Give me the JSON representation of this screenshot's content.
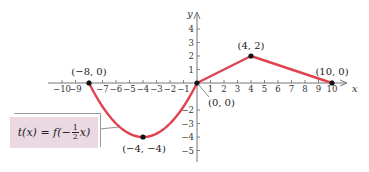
{
  "chart_data": {
    "type": "line",
    "title": "",
    "xlabel": "x",
    "ylabel": "y",
    "xlim": [
      -10.5,
      10.5
    ],
    "ylim": [
      -5.5,
      4.5
    ],
    "grid": false,
    "x_ticks": [
      -10,
      -9,
      -8,
      -7,
      -6,
      -5,
      -4,
      -3,
      -2,
      -1,
      1,
      2,
      3,
      4,
      5,
      6,
      7,
      8,
      9,
      10
    ],
    "x_tick_labels": [
      "−10",
      "−9",
      "",
      "−7",
      "−6",
      "−5",
      "−4",
      "−3",
      "−2",
      "−1",
      "1",
      "2",
      "3",
      "4",
      "5",
      "6",
      "7",
      "8",
      "9",
      "10"
    ],
    "y_ticks": [
      4,
      3,
      2,
      1,
      -2,
      -3,
      -4,
      -5
    ],
    "y_tick_labels": [
      "4",
      "3",
      "2",
      "1",
      "−2",
      "−3",
      "−4",
      "−5"
    ],
    "series": [
      {
        "name": "t(x) = f(−½x)",
        "color": "#e0424f",
        "segments": [
          {
            "kind": "parabola",
            "from": [
              -8,
              0
            ],
            "vertex": [
              -4,
              -4
            ],
            "to": [
              0,
              0
            ]
          },
          {
            "kind": "line",
            "points": [
              [
                0,
                0
              ],
              [
                4,
                2
              ],
              [
                10,
                0
              ]
            ]
          }
        ]
      }
    ],
    "key_points": [
      {
        "x": -8,
        "y": 0,
        "label": "(−8, 0)"
      },
      {
        "x": -4,
        "y": -4,
        "label": "(−4, −4)"
      },
      {
        "x": 0,
        "y": 0,
        "label": "(0, 0)"
      },
      {
        "x": 4,
        "y": 2,
        "label": "(4, 2)"
      },
      {
        "x": 10,
        "y": 0,
        "label": "(10, 0)"
      }
    ],
    "annotations": [
      {
        "text": "t(x) = f(−½x)",
        "type": "function-label-box"
      }
    ]
  },
  "function_label": {
    "prefix": "t(x) = f(−",
    "frac_num": "1",
    "frac_den": "2",
    "suffix": "x)"
  }
}
